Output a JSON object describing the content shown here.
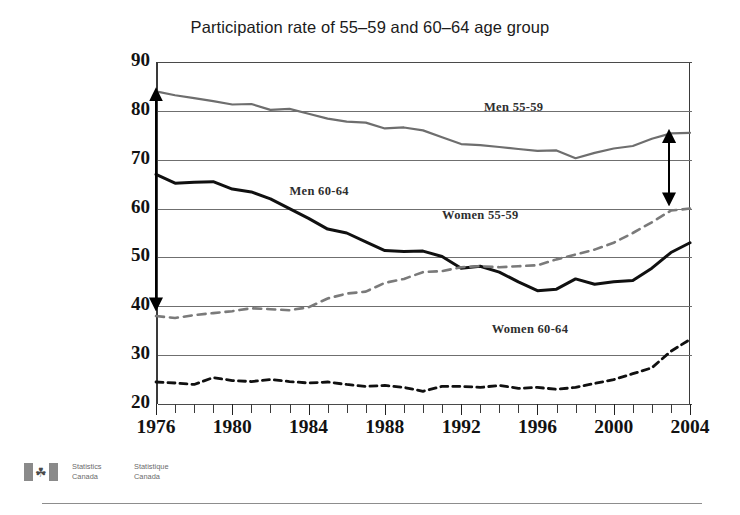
{
  "chart_data": {
    "type": "line",
    "title": "Participation rate of 55–59 and 60–64 age group",
    "xlabel": "",
    "ylabel": "",
    "xlim": [
      1976,
      2004
    ],
    "ylim": [
      20,
      90
    ],
    "ytick_step": 10,
    "grid": true,
    "legend_position": "inline-annotations",
    "x": [
      1976,
      1977,
      1978,
      1979,
      1980,
      1981,
      1982,
      1983,
      1984,
      1985,
      1986,
      1987,
      1988,
      1989,
      1990,
      1991,
      1992,
      1993,
      1994,
      1995,
      1996,
      1997,
      1998,
      1999,
      2000,
      2001,
      2002,
      2003,
      2004
    ],
    "ytick_labels": [
      "20",
      "30",
      "40",
      "50",
      "60",
      "70",
      "80",
      "90"
    ],
    "xtick_labels": [
      "1976",
      "1980",
      "1984",
      "1988",
      "1992",
      "1996",
      "2000",
      "2004"
    ],
    "series": [
      {
        "name": "Men 55-59",
        "style": "solid",
        "color": "#6e6e6e",
        "width": 2.2,
        "label_x": 1993.2,
        "label_y": 80.6,
        "values": [
          84.0,
          83.2,
          82.6,
          82.0,
          81.3,
          81.4,
          80.2,
          80.4,
          79.4,
          78.4,
          77.8,
          77.6,
          76.4,
          76.6,
          76.0,
          74.6,
          73.2,
          73.0,
          72.6,
          72.2,
          71.8,
          71.9,
          70.3,
          71.4,
          72.3,
          72.8,
          74.3,
          75.4,
          75.5
        ]
      },
      {
        "name": "Men 60-64",
        "style": "solid",
        "color": "#101010",
        "width": 3.0,
        "label_x": 1983.0,
        "label_y": 63.4,
        "values": [
          67.0,
          65.2,
          65.4,
          65.5,
          64.0,
          63.4,
          62.0,
          60.0,
          58.0,
          55.8,
          55.0,
          53.2,
          51.4,
          51.2,
          51.3,
          50.2,
          47.8,
          48.2,
          47.0,
          45.0,
          43.2,
          43.5,
          45.6,
          44.5,
          45.0,
          45.3,
          47.8,
          51.0,
          53.0
        ]
      },
      {
        "name": "Women 55-59",
        "style": "dashed",
        "color": "#7a7a7a",
        "width": 2.6,
        "label_x": 1991.0,
        "label_y": 58.4,
        "values": [
          38.0,
          37.6,
          38.2,
          38.6,
          39.0,
          39.6,
          39.4,
          39.2,
          39.8,
          41.6,
          42.6,
          43.0,
          44.8,
          45.6,
          47.0,
          47.2,
          48.0,
          48.2,
          48.0,
          48.2,
          48.4,
          49.6,
          50.6,
          51.6,
          53.0,
          55.0,
          57.2,
          59.6,
          60.0
        ]
      },
      {
        "name": "Women 60-64",
        "style": "dashed",
        "color": "#101010",
        "width": 2.8,
        "label_x": 1993.6,
        "label_y": 35.2,
        "values": [
          24.5,
          24.3,
          24.0,
          25.4,
          24.8,
          24.6,
          25.0,
          24.6,
          24.3,
          24.5,
          24.0,
          23.6,
          23.8,
          23.4,
          22.6,
          23.6,
          23.6,
          23.4,
          23.8,
          23.2,
          23.4,
          23.0,
          23.4,
          24.2,
          25.0,
          26.2,
          27.4,
          30.8,
          33.2
        ]
      }
    ],
    "annotations": [
      {
        "name": "left-range-arrow",
        "x": 1976.0,
        "y_top": 83.5,
        "y_bottom": 40.5
      },
      {
        "name": "right-range-arrow",
        "x": 2002.9,
        "y_top": 75.0,
        "y_bottom": 62.0
      }
    ]
  },
  "footer": {
    "agency_en_line1": "Statistics",
    "agency_en_line2": "Canada",
    "agency_fr_line1": "Statistique",
    "agency_fr_line2": "Canada",
    "flag_glyph": "☘"
  }
}
